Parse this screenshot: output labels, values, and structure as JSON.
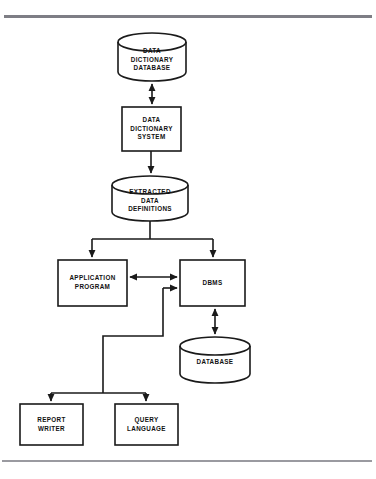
{
  "page": {
    "clipped_header_text": "",
    "background_color": "#ffffff",
    "stroke_color": "#1a1a1a",
    "rule_color": "#8d8d92"
  },
  "diagram": {
    "type": "flowchart",
    "title": "Data Dictionary System",
    "nodes": [
      {
        "id": "data-dictionary-database",
        "shape": "cylinder",
        "lines": [
          "DATA",
          "DICTIONARY",
          "DATABASE"
        ],
        "x": 118,
        "y": 33,
        "w": 68,
        "h": 48
      },
      {
        "id": "data-dictionary-system",
        "shape": "rectangle",
        "lines": [
          "DATA",
          "DICTIONARY",
          "SYSTEM"
        ],
        "x": 122,
        "y": 107,
        "w": 59,
        "h": 44
      },
      {
        "id": "extracted-data-definitions",
        "shape": "cylinder",
        "lines": [
          "EXTRACTED",
          "DATA",
          "DEFINITIONS"
        ],
        "x": 112,
        "y": 176,
        "w": 76,
        "h": 45
      },
      {
        "id": "application-program",
        "shape": "rectangle",
        "lines": [
          "APPLICATION",
          "PROGRAM"
        ],
        "x": 58,
        "y": 260,
        "w": 69,
        "h": 46
      },
      {
        "id": "dbms",
        "shape": "rectangle",
        "lines": [
          "DBMS"
        ],
        "x": 180,
        "y": 260,
        "w": 65,
        "h": 46
      },
      {
        "id": "database",
        "shape": "cylinder",
        "lines": [
          "DATABASE"
        ],
        "x": 180,
        "y": 337,
        "w": 70,
        "h": 46
      },
      {
        "id": "report-writer",
        "shape": "rectangle",
        "lines": [
          "REPORT",
          "WRITER"
        ],
        "x": 20,
        "y": 404,
        "w": 63,
        "h": 41
      },
      {
        "id": "query-language",
        "shape": "rectangle",
        "lines": [
          "QUERY",
          "LANGUAGE"
        ],
        "x": 115,
        "y": 404,
        "w": 63,
        "h": 41
      }
    ],
    "edges": [
      {
        "id": "edge-dd-database-to-dd-system",
        "from": "data-dictionary-database",
        "to": "data-dictionary-system",
        "direction": "bidirectional"
      },
      {
        "id": "edge-dd-system-to-extracted-defs",
        "from": "data-dictionary-system",
        "to": "extracted-data-definitions",
        "direction": "down"
      },
      {
        "id": "edge-extracted-defs-to-application-program",
        "from": "extracted-data-definitions",
        "to": "application-program",
        "direction": "down"
      },
      {
        "id": "edge-extracted-defs-to-dbms",
        "from": "extracted-data-definitions",
        "to": "dbms",
        "direction": "down"
      },
      {
        "id": "edge-application-program-to-dbms",
        "from": "application-program",
        "to": "dbms",
        "direction": "bidirectional"
      },
      {
        "id": "edge-dbms-to-database",
        "from": "dbms",
        "to": "database",
        "direction": "bidirectional"
      },
      {
        "id": "edge-dbms-to-report-writer",
        "from": "dbms",
        "to": "report-writer",
        "direction": "down"
      },
      {
        "id": "edge-dbms-to-query-language",
        "from": "dbms",
        "to": "query-language",
        "direction": "down"
      }
    ]
  }
}
